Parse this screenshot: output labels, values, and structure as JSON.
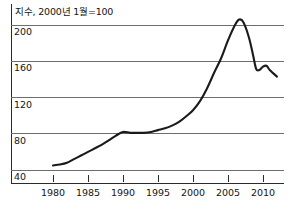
{
  "chart_data": {
    "type": "line",
    "title": "지수, 2000년 1월=100",
    "xlabel": "",
    "ylabel": "",
    "xlim": [
      1977.5,
      2012.5
    ],
    "ylim": [
      28,
      212
    ],
    "grid": true,
    "legend": "none",
    "y_ticks": [
      200,
      160,
      120,
      80,
      40
    ],
    "y_tick_labels": [
      "200",
      "160",
      "120",
      "80",
      "40"
    ],
    "x_ticks": [
      1980,
      1985,
      1990,
      1995,
      2000,
      2005,
      2010
    ],
    "x_tick_labels": [
      "1980",
      "1985",
      "1990",
      "1995",
      "2000",
      "2005",
      "2010"
    ],
    "series": [
      {
        "name": "주택가격지수",
        "color": "#1a1a1a",
        "x": [
          1980.0,
          1981.0,
          1982.0,
          1983.0,
          1984.0,
          1985.0,
          1986.0,
          1987.0,
          1988.0,
          1989.0,
          1990.0,
          1991.0,
          1992.0,
          1993.0,
          1994.0,
          1995.0,
          1996.0,
          1997.0,
          1998.0,
          1999.0,
          2000.0,
          2001.0,
          2002.0,
          2003.0,
          2004.0,
          2005.0,
          2006.0,
          2006.6,
          2007.2,
          2008.0,
          2008.6,
          2009.0,
          2009.4,
          2010.0,
          2010.5,
          2011.0,
          2012.0
        ],
        "y": [
          45,
          46,
          48,
          52,
          56,
          60,
          64,
          68,
          73,
          78,
          82,
          81,
          81,
          81,
          82,
          84,
          86,
          89,
          93,
          99,
          106,
          116,
          130,
          147,
          163,
          183,
          200,
          206,
          203,
          186,
          166,
          152,
          150,
          154,
          155,
          150,
          143
        ]
      }
    ]
  },
  "axes_geometry": {
    "plot_left": 11,
    "plot_right": 284,
    "x_axis_y": 183,
    "y_pixel_200": 25,
    "y_pixel_40": 170,
    "x_pixel_1980": 53,
    "x_pixel_2010": 263
  }
}
